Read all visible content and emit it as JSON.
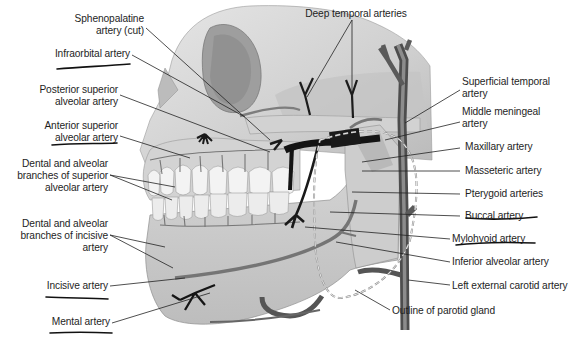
{
  "figure": {
    "colors": {
      "background": "#ffffff",
      "bone": "#d8d8d8",
      "bone_shadow": "#a9a9a9",
      "teeth": "#f2f2f2",
      "artery": "#4a4a4a",
      "artery_dark": "#1a1a1a",
      "leader_line": "#222222",
      "handwritten_underline": "#111111",
      "parotid_outline": "#8a8a8a"
    }
  },
  "labels_left": [
    {
      "id": "sphenopalatine",
      "lines": [
        "Sphenopalatine",
        "artery (cut)"
      ],
      "underlined": false
    },
    {
      "id": "infraorbital",
      "lines": [
        "Infraorbital artery"
      ],
      "underlined": true
    },
    {
      "id": "posterior-superior-alveolar",
      "lines": [
        "Posterior superior",
        "alveolar artery"
      ],
      "underlined": false
    },
    {
      "id": "anterior-superior-alveolar",
      "lines": [
        "Anterior superior",
        "alveolar artery"
      ],
      "underlined": true
    },
    {
      "id": "dental-superior",
      "lines": [
        "Dental and alveolar",
        "branches of superior",
        "alveolar artery"
      ],
      "underlined": false
    },
    {
      "id": "dental-incisive",
      "lines": [
        "Dental and alveolar",
        "branches of incisive",
        "artery"
      ],
      "underlined": false
    },
    {
      "id": "incisive",
      "lines": [
        "Incisive artery"
      ],
      "underlined": true
    },
    {
      "id": "mental",
      "lines": [
        "Mental artery"
      ],
      "underlined": true
    }
  ],
  "labels_top": [
    {
      "id": "deep-temporal",
      "lines": [
        "Deep temporal arteries"
      ],
      "underlined": false
    }
  ],
  "labels_right": [
    {
      "id": "superficial-temporal",
      "lines": [
        "Superficial temporal",
        "artery"
      ],
      "underlined": false
    },
    {
      "id": "middle-meningeal",
      "lines": [
        "Middle meningeal",
        "artery"
      ],
      "underlined": false
    },
    {
      "id": "maxillary",
      "lines": [
        "Maxillary artery"
      ],
      "underlined": false
    },
    {
      "id": "masseteric",
      "lines": [
        "Masseteric artery"
      ],
      "underlined": false
    },
    {
      "id": "pterygoid",
      "lines": [
        "Pterygoid arteries"
      ],
      "underlined": false
    },
    {
      "id": "buccal",
      "lines": [
        "Buccal artery"
      ],
      "underlined": true
    },
    {
      "id": "mylohyoid",
      "lines": [
        "Mylohyoid artery"
      ],
      "underlined": true
    },
    {
      "id": "inferior-alveolar",
      "lines": [
        "Inferior alveolar artery"
      ],
      "underlined": false
    },
    {
      "id": "left-external-carotid",
      "lines": [
        "Left external carotid artery"
      ],
      "underlined": false
    }
  ],
  "labels_bottom": [
    {
      "id": "parotid-outline",
      "lines": [
        "Outline of parotid gland"
      ],
      "underlined": false
    }
  ]
}
